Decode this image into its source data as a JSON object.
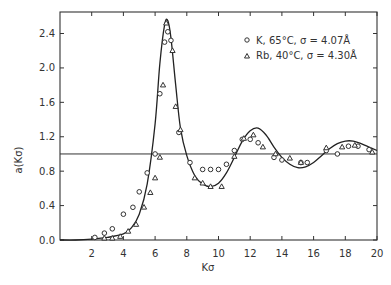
{
  "chart_data": {
    "type": "scatter",
    "title": "",
    "xlabel": "Kσ",
    "ylabel": "a(Kσ)",
    "xlim": [
      0,
      20
    ],
    "ylim": [
      0.0,
      2.65
    ],
    "xticks": [
      2,
      4,
      6,
      8,
      10,
      12,
      14,
      16,
      18,
      20
    ],
    "xtick_labels": [
      "2",
      "4",
      "6",
      "8",
      "10",
      "12",
      "14",
      "16",
      "18",
      "20"
    ],
    "yticks": [
      0.0,
      0.4,
      0.8,
      1.2,
      1.6,
      2.0,
      2.4
    ],
    "ytick_labels": [
      "0.0",
      "0.4",
      "0.8",
      "1.2",
      "1.6",
      "2.0",
      "2.4"
    ],
    "grid": false,
    "reference_line": {
      "y": 1.0,
      "style": "horizontal solid"
    },
    "legend": {
      "position": "upper right",
      "entries": [
        {
          "marker": "circle",
          "label": "K, 65°C, σ = 4.07Å"
        },
        {
          "marker": "triangle",
          "label": "Rb, 40°C, σ = 4.30Å"
        }
      ]
    },
    "series": [
      {
        "name": "K, 65°C, σ = 4.07Å",
        "marker": "circle",
        "x": [
          2.2,
          2.8,
          3.3,
          4.0,
          4.6,
          5.0,
          5.5,
          6.0,
          6.3,
          6.6,
          6.8,
          7.0,
          7.5,
          8.2,
          9.0,
          9.5,
          10.0,
          10.5,
          11.0,
          11.5,
          12.0,
          12.5,
          13.5,
          14.0,
          15.2,
          15.6,
          16.8,
          17.5,
          18.2,
          18.8,
          19.5
        ],
        "values": [
          0.03,
          0.08,
          0.13,
          0.3,
          0.38,
          0.56,
          0.78,
          1.0,
          1.7,
          2.3,
          2.42,
          2.32,
          1.25,
          0.9,
          0.82,
          0.82,
          0.82,
          0.88,
          1.04,
          1.17,
          1.17,
          1.13,
          0.96,
          0.93,
          0.9,
          0.9,
          1.04,
          1.0,
          1.09,
          1.09,
          1.05
        ]
      },
      {
        "name": "Rb, 40°C, σ = 4.30Å",
        "marker": "triangle",
        "x": [
          2.8,
          3.3,
          3.8,
          4.3,
          4.8,
          5.3,
          5.7,
          6.0,
          6.3,
          6.5,
          6.7,
          7.1,
          7.3,
          7.6,
          8.5,
          9.0,
          9.5,
          10.2,
          11.0,
          11.6,
          12.2,
          12.8,
          13.6,
          14.5,
          15.2,
          16.8,
          17.8,
          18.6,
          19.7
        ],
        "values": [
          0.02,
          0.02,
          0.04,
          0.1,
          0.18,
          0.38,
          0.55,
          0.72,
          0.96,
          1.8,
          2.52,
          2.2,
          1.55,
          1.28,
          0.72,
          0.66,
          0.62,
          0.62,
          0.97,
          1.18,
          1.22,
          1.08,
          1.0,
          0.95,
          0.9,
          1.07,
          1.08,
          1.1,
          1.02
        ]
      },
      {
        "name": "theory curve",
        "marker": "none",
        "line": "solid",
        "x": [
          0,
          1,
          2,
          3,
          4,
          4.5,
          5,
          5.5,
          6,
          6.3,
          6.6,
          6.8,
          7.0,
          7.3,
          7.6,
          8.0,
          8.5,
          9.0,
          9.5,
          10.0,
          10.5,
          11.0,
          11.5,
          12.0,
          12.5,
          13.0,
          13.5,
          14.0,
          14.5,
          15.0,
          15.5,
          16.0,
          16.5,
          17.0,
          17.5,
          18.0,
          18.5,
          19.0,
          19.5,
          20.0
        ],
        "values": [
          0.0,
          0.0,
          0.01,
          0.03,
          0.07,
          0.14,
          0.3,
          0.65,
          1.35,
          2.05,
          2.5,
          2.55,
          2.35,
          1.8,
          1.3,
          0.98,
          0.75,
          0.65,
          0.62,
          0.66,
          0.78,
          0.96,
          1.15,
          1.27,
          1.3,
          1.22,
          1.08,
          0.96,
          0.88,
          0.84,
          0.85,
          0.9,
          0.98,
          1.06,
          1.12,
          1.15,
          1.15,
          1.12,
          1.08,
          1.04
        ]
      }
    ]
  }
}
